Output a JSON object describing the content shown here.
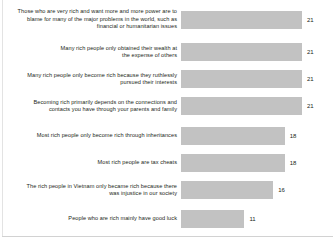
{
  "chart_data": {
    "type": "bar",
    "orientation": "horizontal",
    "title": "",
    "subtitle": "",
    "xlabel": "",
    "ylabel": "",
    "grid": false,
    "legend": null,
    "axis_visible": false,
    "tick_labels": [],
    "xlim": [
      0,
      24
    ],
    "value_labels_shown": true,
    "bar_color": "#c2c2c2",
    "text_color": "#231f20",
    "background_color": "#ffffff",
    "categories": [
      "Those who are very rich and want more and more power are to\nblame for many of the major problems in the world, such as\nfinancial or humanitarian issues",
      "Many rich people only obtained their wealth at\nthe expense of others",
      "Many rich people only become rich because they ruthlessly\npursued their interests",
      "Becoming rich primarily depends on the connections and\ncontacts you have through your parents and family",
      "Most rich people only become rich through inheritances",
      "Most rich people are tax cheats",
      "The rich people in Vietnam only became rich because there\nwas injustice in our society",
      "People who are rich mainly have good luck"
    ],
    "values": [
      21,
      21,
      21,
      21,
      18,
      18,
      16,
      11
    ],
    "value_text": [
      "21",
      "21",
      "21",
      "21",
      "18",
      "18",
      "16",
      "11"
    ]
  },
  "rows": [
    {
      "label": "Those who are very rich and want more and more power are to\nblame for many of the major problems in the world, such as\nfinancial or humanitarian issues",
      "value": 21,
      "value_text": "21"
    },
    {
      "label": "Many rich people only obtained their wealth at\nthe expense of others",
      "value": 21,
      "value_text": "21"
    },
    {
      "label": "Many rich people only become rich because they ruthlessly\npursued their interests",
      "value": 21,
      "value_text": "21"
    },
    {
      "label": "Becoming rich primarily depends on the connections and\ncontacts you have through your parents and family",
      "value": 21,
      "value_text": "21"
    },
    {
      "label": "Most rich people only become rich through inheritances",
      "value": 18,
      "value_text": "18"
    },
    {
      "label": "Most rich people are tax cheats",
      "value": 18,
      "value_text": "18"
    },
    {
      "label": "The rich people in Vietnam only became rich because there\nwas injustice in our society",
      "value": 16,
      "value_text": "16"
    },
    {
      "label": "People who are rich mainly have good luck",
      "value": 11,
      "value_text": "11"
    }
  ]
}
